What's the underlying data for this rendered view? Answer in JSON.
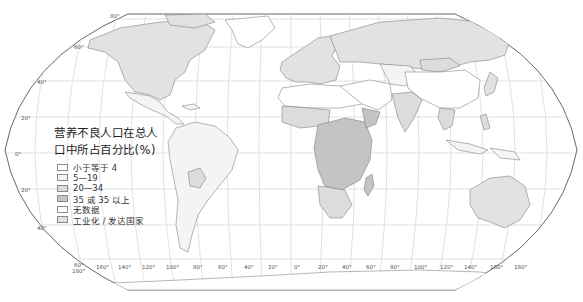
{
  "map": {
    "projection": "Robinson-style world map",
    "colors": {
      "ocean": "#ffffff",
      "graticule": "#c8c8c8",
      "border": "#6f6f6f",
      "frame": "#555555",
      "lt4": "#ffffff",
      "r5_19": "#f4f4f4",
      "r20_34": "#dcdcdc",
      "ge35": "#c4c4c4",
      "nodata": "#ffffff",
      "industrial": "#e2e2e2"
    },
    "lat_labels": [
      "80°",
      "60°",
      "40°",
      "20°",
      "0°",
      "20°",
      "40°",
      "60°"
    ],
    "lon_labels": [
      "180°",
      "160°",
      "140°",
      "120°",
      "100°",
      "80°",
      "60°",
      "40°",
      "20°",
      "0°",
      "20°",
      "40°",
      "60°",
      "80°",
      "100°",
      "120°",
      "140°",
      "160°",
      "180°"
    ]
  },
  "legend": {
    "title_line1": "营养不良人口在总人",
    "title_line2": "口中所占百分比(%)",
    "items": [
      {
        "label": "小于等于 4",
        "color": "#ffffff"
      },
      {
        "label": "5—19",
        "color": "#f4f4f4"
      },
      {
        "label": "20—34",
        "color": "#dcdcdc"
      },
      {
        "label": "35 或 35 以上",
        "color": "#c4c4c4"
      },
      {
        "label": "无数据",
        "color": "#ffffff"
      },
      {
        "label": "工业化 / 发达国家",
        "color": "#e2e2e2"
      }
    ]
  }
}
